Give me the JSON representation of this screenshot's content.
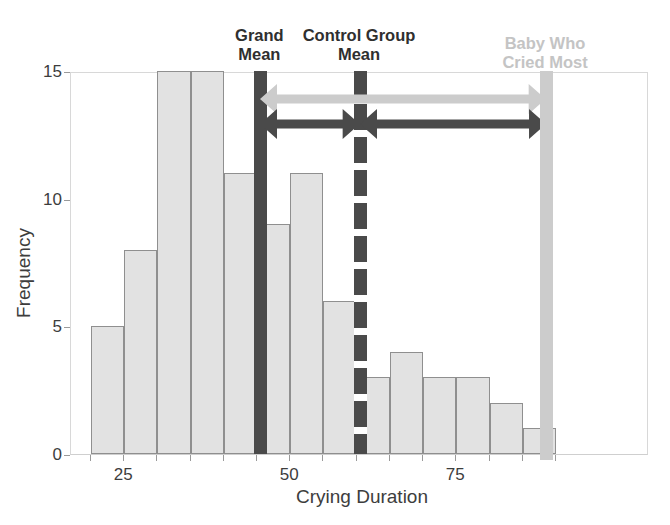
{
  "chart_data": {
    "type": "bar",
    "title": "",
    "subtitle": "",
    "xlabel": "Crying Duration",
    "ylabel": "Frequency",
    "xlim": [
      17,
      104
    ],
    "ylim": [
      0,
      15
    ],
    "grid": false,
    "legend_position": "none",
    "bin_width": 5,
    "bin_starts": [
      20,
      25,
      30,
      35,
      40,
      45,
      50,
      55,
      60,
      65,
      70,
      75,
      80,
      85
    ],
    "categories": [
      "20-25",
      "25-30",
      "30-35",
      "35-40",
      "40-45",
      "45-50",
      "50-55",
      "55-60",
      "60-65",
      "65-70",
      "70-75",
      "75-80",
      "80-85",
      "85-90"
    ],
    "values": [
      5,
      8,
      15,
      15,
      11,
      9,
      11,
      6,
      3,
      4,
      3,
      3,
      2,
      1
    ],
    "xticks": [
      25,
      50,
      75
    ],
    "xtick_labels": [
      "25",
      "50",
      "75"
    ],
    "yticks": [
      0,
      5,
      10,
      15
    ],
    "ytick_labels": [
      "0",
      "5",
      "10",
      "15"
    ],
    "bar_fill": "#e2e2e2",
    "bar_edge": "#8f8f8f",
    "annotations": [
      {
        "name": "grand-mean",
        "label": "Grand\nMean",
        "x": 45.5,
        "style": "solid",
        "color": "#4a4a4a"
      },
      {
        "name": "control-group-mean",
        "label": "Control Group\nMean",
        "x": 60.5,
        "style": "dashed",
        "color": "#4a4a4a"
      },
      {
        "name": "baby-who-cried-most",
        "label": "Baby Who\nCried Most",
        "x": 88.5,
        "style": "dashed",
        "color": "#cccccc"
      }
    ],
    "arrows": [
      {
        "name": "grand-mean-to-baby-arrow",
        "from_x": 45.5,
        "to_x": 88.5,
        "y_frequency": 14.0,
        "color": "#cccccc",
        "double_headed": true
      },
      {
        "name": "grand-mean-to-control-mean-arrow",
        "from_x": 45.5,
        "to_x": 60.5,
        "y_frequency": 13.0,
        "color": "#4a4a4a",
        "double_headed": true
      },
      {
        "name": "control-mean-to-baby-arrow",
        "from_x": 60.5,
        "to_x": 88.5,
        "y_frequency": 13.0,
        "color": "#4a4a4a",
        "double_headed": true
      }
    ]
  },
  "axis": {
    "xlabel": "Crying Duration",
    "ylabel": "Frequency"
  },
  "labels": {
    "grand_mean_line1": "Grand",
    "grand_mean_line2": "Mean",
    "control_mean_line1": "Control Group",
    "control_mean_line2": "Mean",
    "baby_line1": "Baby Who",
    "baby_line2": "Cried Most"
  },
  "xticks": [
    "25",
    "50",
    "75"
  ],
  "yticks": [
    "15",
    "10",
    "5",
    "0"
  ],
  "colors": {
    "bar_fill": "#e2e2e2",
    "bar_edge": "#8f8f8f",
    "dark_accent": "#4a4a4a",
    "light_accent": "#cccccc",
    "text": "#3d3d3d"
  }
}
